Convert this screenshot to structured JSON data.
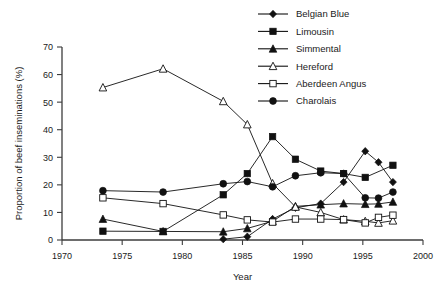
{
  "chart_data": {
    "type": "line",
    "title": "",
    "xlabel": "Year",
    "ylabel": "Proportion of beef inseminations (%)",
    "xlim": [
      1970,
      2000
    ],
    "ylim": [
      0,
      70
    ],
    "xticks": [
      1970,
      1975,
      1980,
      1985,
      1990,
      1995,
      2000
    ],
    "yticks": [
      0,
      10,
      20,
      30,
      40,
      50,
      60,
      70
    ],
    "grid": false,
    "legend_position": "top-right",
    "series": [
      {
        "name": "Belgian Blue",
        "marker": "filled-diamond",
        "x": [
          1983.4,
          1985.4,
          1987.5,
          1989.4,
          1991.5,
          1993.4,
          1995.2,
          1996.3,
          1997.5
        ],
        "values": [
          0.3,
          1.2,
          7.6,
          11.7,
          13.2,
          21.0,
          32.2,
          28.2,
          21.0
        ]
      },
      {
        "name": "Limousin",
        "marker": "filled-square",
        "x": [
          1973.4,
          1978.4,
          1983.4,
          1985.4,
          1987.5,
          1989.4,
          1991.5,
          1993.4,
          1995.2,
          1997.5
        ],
        "values": [
          3.2,
          3.1,
          16.4,
          24.1,
          37.5,
          29.3,
          25.0,
          24.1,
          22.7,
          27.1
        ]
      },
      {
        "name": "Simmental",
        "marker": "filled-triangle",
        "x": [
          1973.4,
          1978.4,
          1983.4,
          1985.4,
          1987.5,
          1989.4,
          1991.5,
          1993.4,
          1995.2,
          1996.3,
          1997.5
        ],
        "values": [
          7.6,
          3.1,
          3.0,
          4.2,
          6.8,
          12.2,
          12.8,
          13.2,
          13.0,
          13.1,
          13.8
        ]
      },
      {
        "name": "Hereford",
        "marker": "open-triangle",
        "x": [
          1973.4,
          1978.4,
          1983.4,
          1985.4,
          1987.5,
          1989.4,
          1991.5,
          1993.4,
          1995.2,
          1996.3,
          1997.5
        ],
        "values": [
          55.3,
          62.1,
          50.3,
          41.9,
          20.5,
          12.0,
          10.0,
          7.4,
          6.8,
          6.2,
          7.0
        ]
      },
      {
        "name": "Aberdeen Angus",
        "marker": "open-square",
        "x": [
          1973.4,
          1978.4,
          1983.4,
          1985.4,
          1987.5,
          1989.4,
          1991.5,
          1993.4,
          1995.2,
          1996.3,
          1997.5
        ],
        "values": [
          15.3,
          13.2,
          9.1,
          7.3,
          6.5,
          7.6,
          7.6,
          7.4,
          6.2,
          8.2,
          9.0
        ]
      },
      {
        "name": "Charolais",
        "marker": "filled-circle",
        "x": [
          1973.4,
          1978.4,
          1983.4,
          1985.4,
          1987.5,
          1989.4,
          1991.5,
          1993.4,
          1995.2,
          1996.3,
          1997.5
        ],
        "values": [
          17.9,
          17.4,
          20.4,
          21.2,
          19.3,
          23.3,
          24.4,
          24.1,
          15.3,
          15.2,
          17.4
        ]
      }
    ]
  }
}
